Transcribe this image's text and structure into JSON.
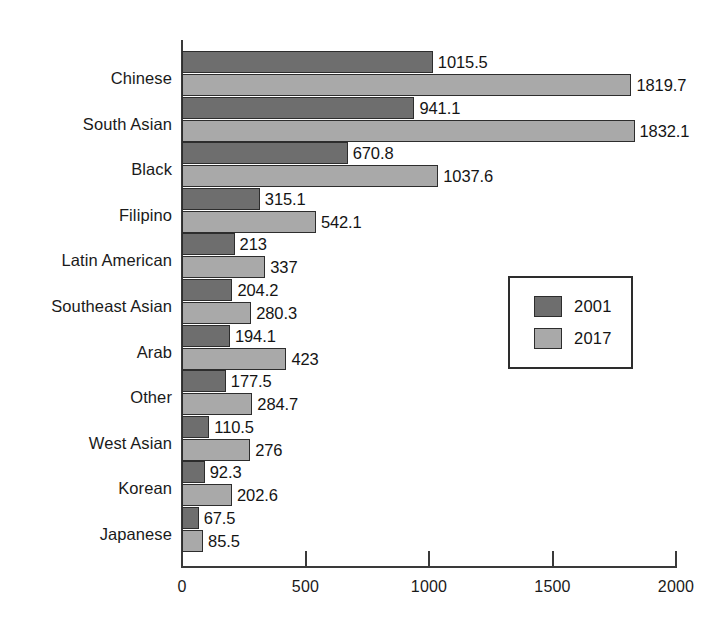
{
  "chart_data": {
    "type": "bar",
    "orientation": "horizontal",
    "title": "",
    "subtitle": "",
    "xlabel": "",
    "ylabel": "",
    "xlim": [
      0,
      2000
    ],
    "xticks": [
      0,
      500,
      1000,
      1500,
      2000
    ],
    "xtick_labels": [
      "0",
      "500",
      "1000",
      "1500",
      "2000"
    ],
    "grid": false,
    "legend_position": "center-right",
    "categories": [
      "Chinese",
      "South Asian",
      "Black",
      "Filipino",
      "Latin American",
      "Southeast Asian",
      "Arab",
      "Other",
      "West Asian",
      "Korean",
      "Japanese"
    ],
    "series": [
      {
        "name": "2001",
        "color": "#6e6e6e",
        "values": [
          1015.5,
          941.1,
          670.8,
          315.1,
          213,
          204.2,
          194.1,
          177.5,
          110.5,
          92.3,
          67.5
        ],
        "labels": [
          "1015.5",
          "941.1",
          "670.8",
          "315.1",
          "213",
          "204.2",
          "194.1",
          "177.5",
          "110.5",
          "92.3",
          "67.5"
        ]
      },
      {
        "name": "2017",
        "color": "#a9a9a9",
        "values": [
          1819.7,
          1832.1,
          1037.6,
          542.1,
          337,
          280.3,
          423,
          284.7,
          276,
          202.6,
          85.5
        ],
        "labels": [
          "1819.7",
          "1832.1",
          "1037.6",
          "542.1",
          "337",
          "280.3",
          "423",
          "284.7",
          "276",
          "202.6",
          "85.5"
        ]
      }
    ]
  },
  "legend": {
    "entries": [
      {
        "label": "2001",
        "color": "#6e6e6e"
      },
      {
        "label": "2017",
        "color": "#a9a9a9"
      }
    ]
  },
  "colors": {
    "series_2001": "#6e6e6e",
    "series_2017": "#a9a9a9",
    "axis": "#3a3a3a",
    "text": "#1a1a1a",
    "background": "#ffffff"
  }
}
